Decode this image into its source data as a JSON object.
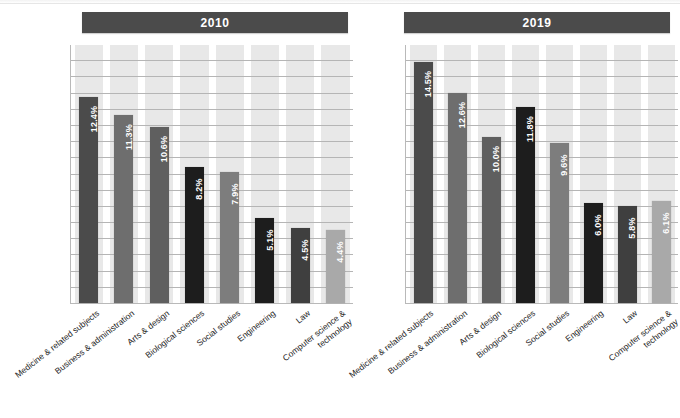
{
  "chart_data": {
    "type": "bar",
    "title": "",
    "subtitle": "",
    "xlabel": "",
    "ylabel": "",
    "ylim": [
      0,
      15.5
    ],
    "grid": true,
    "gridline_count": 16,
    "legend_position": "none",
    "value_suffix": "%",
    "categories": [
      "Medicine & related subjects",
      "Business & administration",
      "Arts & design",
      "Biological sciences",
      "Social studies",
      "Engineering",
      "Law",
      "Computer science &\ntechnology"
    ],
    "series": [
      {
        "name": "2010",
        "values": [
          12.4,
          11.3,
          10.6,
          8.2,
          7.9,
          5.1,
          4.5,
          4.4
        ],
        "labels": [
          "12.4%",
          "11.3%",
          "10.6%",
          "8.2%",
          "7.9%",
          "5.1%",
          "4.5%",
          "4.4%"
        ]
      },
      {
        "name": "2019",
        "values": [
          14.5,
          12.6,
          10.0,
          11.8,
          9.6,
          6.0,
          5.8,
          6.1
        ],
        "labels": [
          "14.5%",
          "12.6%",
          "10.0%",
          "11.8%",
          "9.6%",
          "6.0%",
          "5.8%",
          "6.1%"
        ]
      }
    ],
    "bar_colors": [
      "#4b4b4b",
      "#6e6e6e",
      "#5f5f5f",
      "#1d1d1d",
      "#7d7d7d",
      "#1d1d1d",
      "#3f3f3f",
      "#a9a9a9"
    ],
    "band_color": "#e8e8e8",
    "gridline_color": "#b5b5b5",
    "axis_color": "#b9b9b9",
    "header_color": "#4b4b4b",
    "header_text_color": "#ffffff"
  },
  "panels": [
    {
      "year_label": "2010",
      "series_index": 0
    },
    {
      "year_label": "2019",
      "series_index": 1
    }
  ]
}
